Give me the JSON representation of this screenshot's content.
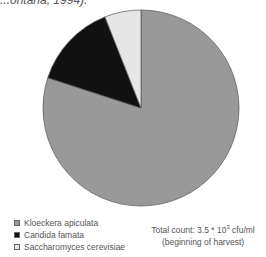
{
  "caption_fragment": "...ontana, 1994).",
  "chart_data": {
    "type": "pie",
    "title": "",
    "categories": [
      "Kloeckera apiculata",
      "Candida famata",
      "Saccharomyces cerevisiae"
    ],
    "values": [
      80,
      14,
      6
    ],
    "colors": [
      "#999999",
      "#111111",
      "#e6e6e6"
    ],
    "start_angle": "12 o'clock, clockwise",
    "legend_position": "bottom-left",
    "annotation": {
      "line1": "Total count: 3.5 * 10",
      "exponent": "3",
      "unit": " cfu/ml",
      "line2": "(beginning of harvest)"
    }
  }
}
